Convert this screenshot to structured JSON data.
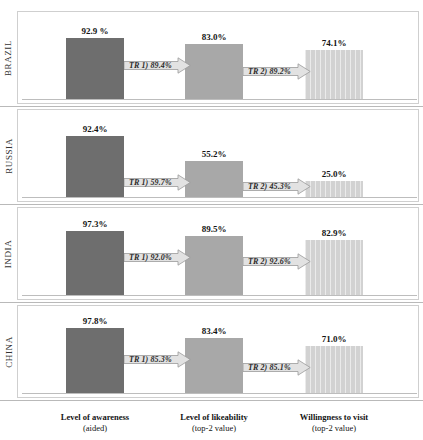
{
  "top_strip": {
    "visible_fragment": ""
  },
  "colors": {
    "stage1": "#6e6e6e",
    "stage2": "#a8a8a8",
    "stage3": "#d2d2d2",
    "arrow_fill": "#e2e2e2",
    "arrow_stroke": "#9a9a9a",
    "panel_border": "#cfcfcf",
    "baseline": "#bdbdbd",
    "text": "#141414"
  },
  "axis": {
    "categories": [
      {
        "title": "Level of awareness",
        "subtitle": "(aided)"
      },
      {
        "title": "Level of likeability",
        "subtitle": "(top-2 value)"
      },
      {
        "title": "Willingness to visit",
        "subtitle": "(top-2 value)"
      }
    ]
  },
  "panels": [
    {
      "country": "BRAZIL",
      "bars": [
        {
          "label": "92.9 %",
          "value": 92.9
        },
        {
          "label": "83.0%",
          "value": 83.0
        },
        {
          "label": "74.1%",
          "value": 74.1
        }
      ],
      "arrows": [
        {
          "label": "TR 1) 89.4%",
          "value": 89.4
        },
        {
          "label": "TR 2)  89.2%",
          "value": 89.2
        }
      ]
    },
    {
      "country": "RUSSIA",
      "bars": [
        {
          "label": "92.4%",
          "value": 92.4
        },
        {
          "label": "55.2%",
          "value": 55.2
        },
        {
          "label": "25.0%",
          "value": 25.0
        }
      ],
      "arrows": [
        {
          "label": "TR 1) 59.7%",
          "value": 59.7
        },
        {
          "label": "TR 2) 45.3%",
          "value": 45.3
        }
      ]
    },
    {
      "country": "INDIA",
      "bars": [
        {
          "label": "97.3%",
          "value": 97.3
        },
        {
          "label": "89.5%",
          "value": 89.5
        },
        {
          "label": "82.9%",
          "value": 82.9
        }
      ],
      "arrows": [
        {
          "label": "TR 1) 92.0%",
          "value": 92.0
        },
        {
          "label": "TR 2) 92.6%",
          "value": 92.6
        }
      ]
    },
    {
      "country": "CHINA",
      "bars": [
        {
          "label": "97.8%",
          "value": 97.8
        },
        {
          "label": "83.4%",
          "value": 83.4
        },
        {
          "label": "71.0%",
          "value": 71.0
        }
      ],
      "arrows": [
        {
          "label": "TR 1) 85.3%",
          "value": 85.3
        },
        {
          "label": "TR 2) 85.1%",
          "value": 85.1
        }
      ]
    }
  ],
  "chart_data": {
    "type": "bar",
    "title": "",
    "subtitle": "",
    "xlabel": "",
    "ylabel": "",
    "ylim": [
      0,
      100
    ],
    "grid": false,
    "legend_position": "none",
    "panel_layout": "4 stacked country panels, each a 3-stage funnel with transfer-rate arrows",
    "categories": [
      "Level of awareness (aided)",
      "Level of likeability (top-2 value)",
      "Willingness to visit (top-2 value)"
    ],
    "series": [
      {
        "name": "BRAZIL",
        "values": [
          92.9,
          83.0,
          74.1
        ]
      },
      {
        "name": "RUSSIA",
        "values": [
          92.4,
          55.2,
          25.0
        ]
      },
      {
        "name": "INDIA",
        "values": [
          97.3,
          89.5,
          82.9
        ]
      },
      {
        "name": "CHINA",
        "values": [
          97.8,
          83.4,
          71.0
        ]
      }
    ],
    "annotations": [
      {
        "panel": "BRAZIL",
        "from": "Level of awareness",
        "to": "Level of likeability",
        "text": "TR 1) 89.4%",
        "value": 89.4
      },
      {
        "panel": "BRAZIL",
        "from": "Level of likeability",
        "to": "Willingness to visit",
        "text": "TR 2)  89.2%",
        "value": 89.2
      },
      {
        "panel": "RUSSIA",
        "from": "Level of awareness",
        "to": "Level of likeability",
        "text": "TR 1) 59.7%",
        "value": 59.7
      },
      {
        "panel": "RUSSIA",
        "from": "Level of likeability",
        "to": "Willingness to visit",
        "text": "TR 2) 45.3%",
        "value": 45.3
      },
      {
        "panel": "INDIA",
        "from": "Level of awareness",
        "to": "Level of likeability",
        "text": "TR 1) 92.0%",
        "value": 92.0
      },
      {
        "panel": "INDIA",
        "from": "Level of likeability",
        "to": "Willingness to visit",
        "text": "TR 2) 92.6%",
        "value": 92.6
      },
      {
        "panel": "CHINA",
        "from": "Level of awareness",
        "to": "Level of likeability",
        "text": "TR 1) 85.3%",
        "value": 85.3
      },
      {
        "panel": "CHINA",
        "from": "Level of likeability",
        "to": "Willingness to visit",
        "text": "TR 2) 85.1%",
        "value": 85.1
      }
    ]
  }
}
